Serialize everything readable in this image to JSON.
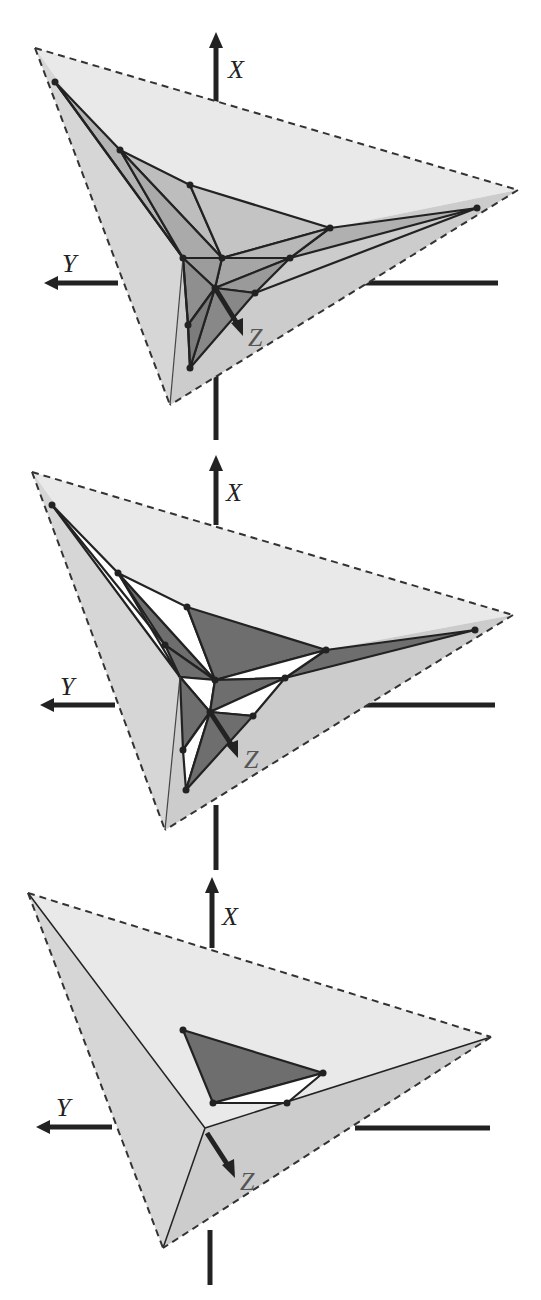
{
  "figure": {
    "panels": [
      {
        "id": "panel-1",
        "axis_labels": {
          "x": "X",
          "y": "Y",
          "z": "Z"
        },
        "description": "Tetrahedral-corner surface with nested triangulated sheets (all filled gray)"
      },
      {
        "id": "panel-2",
        "axis_labels": {
          "x": "X",
          "y": "Y",
          "z": "Z"
        },
        "description": "Same triangulation with alternating dark and white faces"
      },
      {
        "id": "panel-3",
        "axis_labels": {
          "x": "X",
          "y": "Y",
          "z": "Z"
        },
        "description": "Corner surface with a single dark triangle and white sliver"
      }
    ],
    "colors": {
      "background": "#ffffff",
      "plane_light": "#e6e6e6",
      "plane_mid": "#cfcfcf",
      "face_mid": "#a8a8a8",
      "face_dark": "#6e6e6e",
      "face_white": "#ffffff",
      "stroke": "#222222"
    }
  }
}
